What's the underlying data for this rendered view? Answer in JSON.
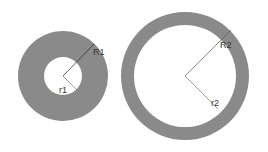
{
  "diagram": {
    "title": "",
    "colors": {
      "ring": "#8a8a8a",
      "line": "#444444",
      "thin_line": "#777777",
      "background": "#ffffff"
    },
    "annuli": [
      {
        "name": "small-annulus",
        "outer_label": "R1",
        "inner_label": "r1"
      },
      {
        "name": "large-annulus",
        "outer_label": "R2",
        "inner_label": "r2"
      }
    ]
  }
}
